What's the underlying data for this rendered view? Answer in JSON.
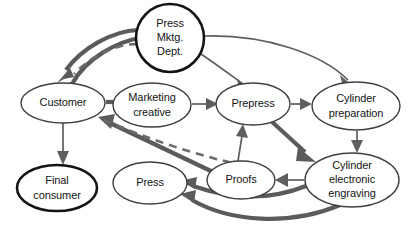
{
  "diagram": {
    "background_color": "#ffffff",
    "nodes": [
      {
        "id": "press_mktg_dept",
        "lines": [
          "Press",
          "Mktg.",
          "Dept."
        ],
        "shape": "circle",
        "emphasis": "thick",
        "cx": 170,
        "cy": 38,
        "rx": 34,
        "ry": 34
      },
      {
        "id": "customer",
        "lines": [
          "Customer"
        ],
        "shape": "ellipse",
        "emphasis": "thin",
        "cx": 63,
        "cy": 103,
        "rx": 42,
        "ry": 20
      },
      {
        "id": "marketing_creative",
        "lines": [
          "Marketing",
          "creative"
        ],
        "shape": "ellipse",
        "emphasis": "thin",
        "cx": 152,
        "cy": 105,
        "rx": 39,
        "ry": 22
      },
      {
        "id": "prepress",
        "lines": [
          "Prepress"
        ],
        "shape": "ellipse",
        "emphasis": "thin",
        "cx": 253,
        "cy": 104,
        "rx": 37,
        "ry": 21
      },
      {
        "id": "cylinder_preparation",
        "lines": [
          "Cylinder",
          "preparation"
        ],
        "shape": "ellipse",
        "emphasis": "thin",
        "cx": 356,
        "cy": 106,
        "rx": 44,
        "ry": 24
      },
      {
        "id": "final_consumer",
        "lines": [
          "Final",
          "consumer"
        ],
        "shape": "ellipse",
        "emphasis": "thick",
        "cx": 57,
        "cy": 188,
        "rx": 40,
        "ry": 23
      },
      {
        "id": "press",
        "lines": [
          "Press"
        ],
        "shape": "ellipse",
        "emphasis": "thin",
        "cx": 150,
        "cy": 183,
        "rx": 37,
        "ry": 21
      },
      {
        "id": "proofs",
        "lines": [
          "Proofs"
        ],
        "shape": "ellipse",
        "emphasis": "thin",
        "cx": 241,
        "cy": 180,
        "rx": 34,
        "ry": 19
      },
      {
        "id": "cylinder_electronic_engraving",
        "lines": [
          "Cylinder",
          "electronic",
          "engraving"
        ],
        "shape": "ellipse",
        "emphasis": "thin",
        "cx": 352,
        "cy": 180,
        "rx": 47,
        "ry": 27
      }
    ],
    "edges": [
      {
        "id": "customer-to-press_mktg_dept",
        "from": "customer",
        "to": "press_mktg_dept",
        "style": "thick"
      },
      {
        "id": "press_mktg_dept-to-customer",
        "from": "press_mktg_dept",
        "to": "customer",
        "style": "thick"
      },
      {
        "id": "press_mktg_dept-to-customer-dashed",
        "from": "press_mktg_dept",
        "to": "customer",
        "style": "dashed"
      },
      {
        "id": "customer-to-marketing_creative",
        "from": "customer",
        "to": "marketing_creative",
        "style": "thick"
      },
      {
        "id": "marketing_creative-to-prepress",
        "from": "marketing_creative",
        "to": "prepress",
        "style": "thin"
      },
      {
        "id": "press_mktg_dept-to-prepress",
        "from": "press_mktg_dept",
        "to": "prepress",
        "style": "thin"
      },
      {
        "id": "press_mktg_dept-to-cylinder_preparation",
        "from": "press_mktg_dept",
        "to": "cylinder_preparation",
        "style": "thin"
      },
      {
        "id": "prepress-to-cylinder_preparation",
        "from": "prepress",
        "to": "cylinder_preparation",
        "style": "thin"
      },
      {
        "id": "cylinder_preparation-to-cylinder_electronic_engraving",
        "from": "cylinder_preparation",
        "to": "cylinder_electronic_engraving",
        "style": "thin"
      },
      {
        "id": "prepress-to-cylinder_electronic_engraving",
        "from": "prepress",
        "to": "cylinder_electronic_engraving",
        "style": "thick"
      },
      {
        "id": "cylinder_electronic_engraving-to-proofs",
        "from": "cylinder_electronic_engraving",
        "to": "proofs",
        "style": "thin"
      },
      {
        "id": "proofs-to-prepress",
        "from": "proofs",
        "to": "prepress",
        "style": "thin"
      },
      {
        "id": "proofs-to-customer",
        "from": "proofs",
        "to": "customer",
        "style": "thick"
      },
      {
        "id": "cylinder_electronic_engraving-to-press",
        "from": "cylinder_electronic_engraving",
        "to": "press",
        "style": "thick"
      },
      {
        "id": "press-to-customer-dashed",
        "from": "press",
        "to": "customer",
        "style": "dashed"
      },
      {
        "id": "customer-to-final_consumer",
        "from": "customer",
        "to": "final_consumer",
        "style": "thin"
      },
      {
        "id": "cylinder_electronic_engraving-to-press-lower",
        "from": "cylinder_electronic_engraving",
        "to": "press",
        "style": "thick"
      }
    ]
  }
}
